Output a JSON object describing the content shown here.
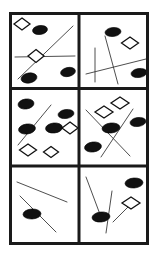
{
  "figure": {
    "caption": "",
    "canvas": {
      "width": 157,
      "height": 261
    },
    "colors": {
      "background": "#ffffff",
      "frame": "#1a1a1a",
      "divider": "#1a1a1a",
      "ellipse_fill": "#111111",
      "ellipse_stroke": "#000000",
      "diamond_fill": "#ffffff",
      "diamond_stroke": "#111111",
      "line_stroke": "#3a3a3a",
      "caption_text": "#d8d8d8"
    },
    "frame": {
      "x": 10.5,
      "y": 13.5,
      "width": 137,
      "height": 230,
      "stroke_width": 3
    },
    "dividers": {
      "vertical_x": 79,
      "horizontal_y": [
        88.5,
        166
      ],
      "stroke_width": 3
    },
    "panels": [
      {
        "id": "panel-top-left",
        "label": "top-left",
        "bounds": {
          "x": 12,
          "y": 15,
          "width": 67,
          "height": 73
        },
        "counts": {
          "ellipses": 3,
          "diamonds": 2,
          "lines": 2
        },
        "ellipses": [
          {
            "cx": 40,
            "cy": 30,
            "rx": 7.5,
            "ry": 4.5,
            "rot": -8
          },
          {
            "cx": 29,
            "cy": 78,
            "rx": 8,
            "ry": 5,
            "rot": -10
          },
          {
            "cx": 68,
            "cy": 72,
            "rx": 7.5,
            "ry": 4.5,
            "rot": -12
          }
        ],
        "diamonds": [
          {
            "cx": 22,
            "cy": 24,
            "rx": 8,
            "ry": 6,
            "rot": 0
          },
          {
            "cx": 36,
            "cy": 56,
            "rx": 8,
            "ry": 6.5,
            "rot": 0
          }
        ],
        "lines": [
          {
            "x1": 18,
            "y1": 79,
            "x2": 73,
            "y2": 26
          },
          {
            "x1": 15,
            "y1": 57,
            "x2": 75,
            "y2": 56
          }
        ]
      },
      {
        "id": "panel-top-right",
        "label": "top-right",
        "bounds": {
          "x": 80,
          "y": 15,
          "width": 67,
          "height": 73
        },
        "counts": {
          "ellipses": 2,
          "diamonds": 1,
          "lines": 3
        },
        "ellipses": [
          {
            "cx": 113,
            "cy": 32,
            "rx": 8,
            "ry": 4.5,
            "rot": -6
          },
          {
            "cx": 139,
            "cy": 73,
            "rx": 8,
            "ry": 4.5,
            "rot": -8
          }
        ],
        "diamonds": [
          {
            "cx": 130,
            "cy": 43,
            "rx": 8.5,
            "ry": 6,
            "rot": 0
          }
        ],
        "lines": [
          {
            "x1": 95,
            "y1": 48,
            "x2": 95,
            "y2": 82
          },
          {
            "x1": 105,
            "y1": 36,
            "x2": 118,
            "y2": 84
          },
          {
            "x1": 86,
            "y1": 74,
            "x2": 146,
            "y2": 59
          }
        ]
      },
      {
        "id": "panel-middle-left",
        "label": "middle-left",
        "bounds": {
          "x": 12,
          "y": 90,
          "width": 67,
          "height": 75
        },
        "counts": {
          "ellipses": 4,
          "diamonds": 3,
          "lines": 1
        },
        "ellipses": [
          {
            "cx": 26,
            "cy": 104,
            "rx": 8,
            "ry": 5,
            "rot": -8
          },
          {
            "cx": 66,
            "cy": 114,
            "rx": 8,
            "ry": 4.5,
            "rot": -8
          },
          {
            "cx": 27,
            "cy": 129,
            "rx": 8.5,
            "ry": 5,
            "rot": -8
          },
          {
            "cx": 54,
            "cy": 128,
            "rx": 8.5,
            "ry": 5,
            "rot": -6
          }
        ],
        "diamonds": [
          {
            "cx": 70,
            "cy": 128,
            "rx": 8,
            "ry": 6,
            "rot": 0
          },
          {
            "cx": 28,
            "cy": 150,
            "rx": 8.5,
            "ry": 6,
            "rot": 0
          },
          {
            "cx": 51,
            "cy": 152,
            "rx": 7.5,
            "ry": 5.5,
            "rot": 0
          }
        ],
        "lines": [
          {
            "x1": 18,
            "y1": 145,
            "x2": 51,
            "y2": 105
          }
        ]
      },
      {
        "id": "panel-middle-right",
        "label": "middle-right",
        "bounds": {
          "x": 80,
          "y": 90,
          "width": 67,
          "height": 75
        },
        "counts": {
          "ellipses": 3,
          "diamonds": 2,
          "lines": 2
        },
        "ellipses": [
          {
            "cx": 111,
            "cy": 128,
            "rx": 9,
            "ry": 5,
            "rot": -6
          },
          {
            "cx": 138,
            "cy": 122,
            "rx": 8,
            "ry": 4.5,
            "rot": -8
          },
          {
            "cx": 93,
            "cy": 147,
            "rx": 8.5,
            "ry": 5,
            "rot": -8
          },
          {
            "cx": 0,
            "cy": 0,
            "rx": 0,
            "ry": 0,
            "rot": 0
          }
        ],
        "diamonds": [
          {
            "cx": 104,
            "cy": 112,
            "rx": 9,
            "ry": 6,
            "rot": 0
          },
          {
            "cx": 120,
            "cy": 103,
            "rx": 9,
            "ry": 6,
            "rot": 0
          }
        ],
        "lines": [
          {
            "x1": 86,
            "y1": 110,
            "x2": 130,
            "y2": 156
          },
          {
            "x1": 133,
            "y1": 109,
            "x2": 101,
            "y2": 157
          }
        ]
      },
      {
        "id": "panel-bottom-left",
        "label": "bottom-left",
        "bounds": {
          "x": 12,
          "y": 167,
          "width": 67,
          "height": 76
        },
        "counts": {
          "ellipses": 1,
          "diamonds": 0,
          "lines": 2
        },
        "ellipses": [
          {
            "cx": 32,
            "cy": 214,
            "rx": 9,
            "ry": 5,
            "rot": -3
          }
        ],
        "diamonds": [],
        "lines": [
          {
            "x1": 17,
            "y1": 182,
            "x2": 67,
            "y2": 202
          },
          {
            "x1": 20,
            "y1": 196,
            "x2": 56,
            "y2": 232
          }
        ]
      },
      {
        "id": "panel-bottom-right",
        "label": "bottom-right",
        "bounds": {
          "x": 80,
          "y": 167,
          "width": 67,
          "height": 76
        },
        "counts": {
          "ellipses": 2,
          "diamonds": 1,
          "lines": 3
        },
        "ellipses": [
          {
            "cx": 134,
            "cy": 183,
            "rx": 9,
            "ry": 5,
            "rot": -4
          },
          {
            "cx": 101,
            "cy": 217,
            "rx": 9,
            "ry": 5,
            "rot": -6
          }
        ],
        "diamonds": [
          {
            "cx": 131,
            "cy": 203,
            "rx": 9,
            "ry": 6,
            "rot": 0
          }
        ],
        "lines": [
          {
            "x1": 86,
            "y1": 177,
            "x2": 101,
            "y2": 217
          },
          {
            "x1": 112,
            "y1": 191,
            "x2": 106,
            "y2": 233
          },
          {
            "x1": 113,
            "y1": 222,
            "x2": 134,
            "y2": 201
          }
        ]
      }
    ]
  }
}
